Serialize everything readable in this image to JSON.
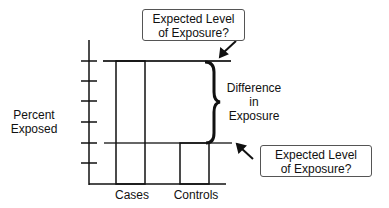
{
  "diagram": {
    "y_axis_label_line1": "Percent",
    "y_axis_label_line2": "Exposed",
    "x_categories": [
      "Cases",
      "Controls"
    ],
    "top_callout_line1": "Expected Level",
    "top_callout_line2": "of Exposure?",
    "bottom_callout_line1": "Expected Level",
    "bottom_callout_line2": "of Exposure?",
    "brace_label_line1": "Difference",
    "brace_label_line2": "in",
    "brace_label_line3": "Exposure"
  }
}
